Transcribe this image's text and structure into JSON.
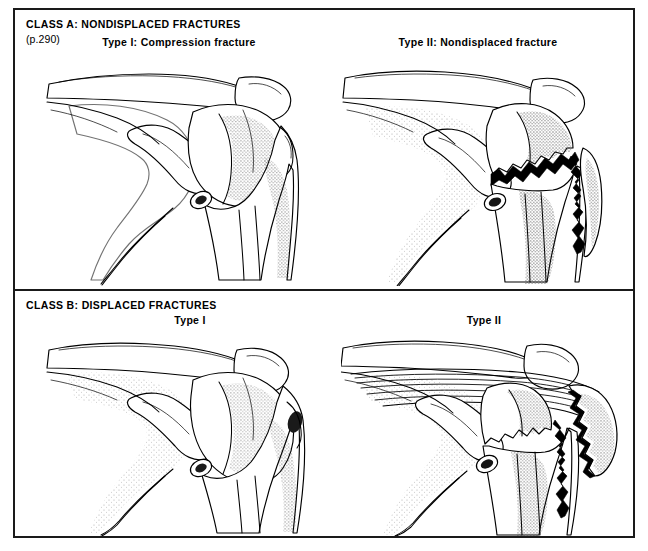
{
  "figure": {
    "border_color": "#1a1a1a",
    "ink_color": "#000000",
    "background": "#ffffff"
  },
  "panels": [
    {
      "id": "class-a",
      "heading": "CLASS A: NONDISPLACED FRACTURES",
      "page_ref": "(p.290)",
      "figures": [
        {
          "id": "a-type1",
          "label": "Type I: Compression fracture",
          "description": "Anterior view of shoulder: clavicle, acromion, coracoid, scapula and proximal humerus with compression of the humeral head, no fracture line"
        },
        {
          "id": "a-type2",
          "label": "Type II: Nondisplaced fracture",
          "description": "Anterior view of shoulder with jagged nondisplaced fracture through anatomic neck and greater tuberosity of the proximal humerus"
        }
      ]
    },
    {
      "id": "class-b",
      "heading": "CLASS B: DISPLACED FRACTURES",
      "page_ref": "",
      "figures": [
        {
          "id": "b-type1",
          "label": "Type I",
          "description": "Anterior view of shoulder with intact proximal humerus contour, displaced fracture pattern baseline"
        },
        {
          "id": "b-type2",
          "label": "Type II",
          "description": "Anterior view of shoulder with greater tuberosity fragment displaced laterally and superiorly, retracted by rotator cuff muscle fibers"
        }
      ]
    }
  ]
}
